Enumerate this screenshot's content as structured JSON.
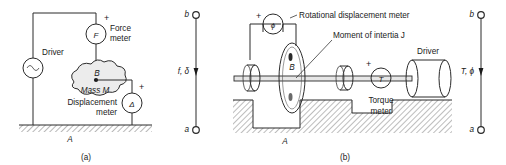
{
  "figure": {
    "panels": [
      {
        "id": "a",
        "caption": "(a)",
        "ground_label": "A",
        "driver_label": "Driver",
        "driver_symbol": "sine-source",
        "force_meter": {
          "symbol": "F",
          "label_line1": "Force",
          "label_line2": "meter",
          "polarity": "+"
        },
        "displacement_meter": {
          "symbol": "Δ",
          "label_line1": "Displacement",
          "label_line2": "meter",
          "polarity": "+"
        },
        "mass_label": "Mass  M",
        "node_label": "B",
        "port": {
          "top_terminal": "b",
          "bottom_terminal": "a",
          "variables": "f,  δ"
        }
      },
      {
        "id": "b",
        "caption": "(b)",
        "ground_label": "A",
        "driver_label": "Driver",
        "rotational_displacement_meter": {
          "symbol": "ϕ",
          "label": "Rotational displacement meter",
          "polarity": "+"
        },
        "torque_meter": {
          "symbol": "T",
          "label_line1": "Torque",
          "label_line2": "meter",
          "polarity": "+"
        },
        "inertia_label": "Moment of intertia J",
        "node_label": "B",
        "port": {
          "top_terminal": "b",
          "bottom_terminal": "a",
          "variables": "T,  ϕ"
        }
      }
    ],
    "colors": {
      "ink": "#2a2a2a",
      "hatch": "#8a8a8a",
      "mass_fill": "#ececec",
      "background": "#ffffff"
    }
  }
}
